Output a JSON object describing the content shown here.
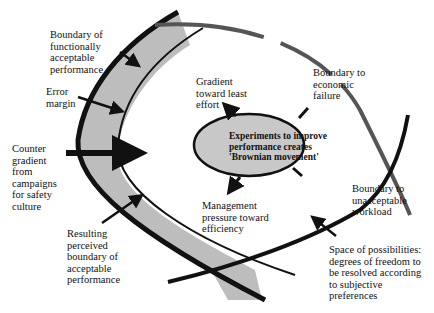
{
  "diagram": {
    "type": "conceptual-model",
    "labels": {
      "boundary_functional": "Boundary of\nfunctionally\nacceptable\nperformance",
      "error_margin": "Error\nmargin",
      "counter_gradient": "Counter\ngradient\nfrom\ncampaigns\nfor safety\nculture",
      "resulting_boundary": "Resulting\nperceived\nboundary of\nacceptable\nperformance",
      "gradient_least_effort": "Gradient\ntoward least\neffort",
      "boundary_economic": "Boundary to\neconomic\nfailure",
      "experiments": "Experiments to improve\nperformance creates\n'Brownian movement'",
      "management_pressure": "Management\npressure toward\nefficiency",
      "boundary_workload": "Boundary to\nunacceptable\nworkload",
      "space_of_possibilities": "Space of possibilities:\ndegrees of freedom to\nbe resolved according\nto subjective\npreferences"
    },
    "colors": {
      "band_fill": "#bdbdbd",
      "ellipse_fill": "#c8c8c8",
      "stroke": "#111111",
      "economic_boundary": "#555555",
      "background": "#ffffff"
    }
  }
}
